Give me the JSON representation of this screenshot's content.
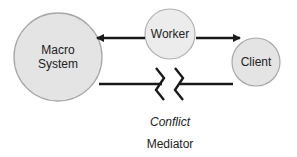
{
  "diagram": {
    "nodes": [
      {
        "id": "macro",
        "label_line1": "Macro",
        "label_line2": "System"
      },
      {
        "id": "worker",
        "label": "Worker"
      },
      {
        "id": "client",
        "label": "Client"
      }
    ],
    "edges": [
      {
        "from": "worker",
        "to": "macro",
        "type": "arrow"
      },
      {
        "from": "worker",
        "to": "client",
        "type": "arrow"
      },
      {
        "from": "macro",
        "to": "client",
        "type": "broken-line",
        "note": "conflict break"
      }
    ],
    "conflict_label": "Conflict",
    "caption": "Mediator",
    "colors": {
      "node_fill": "#e4e4e4",
      "node_stroke": "#a8a8a8",
      "line": "#1a1a1a"
    }
  }
}
